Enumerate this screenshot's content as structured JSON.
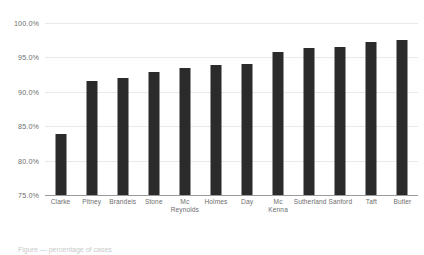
{
  "chart_data": {
    "type": "bar",
    "title": "",
    "subtitle": "",
    "xlabel": "",
    "ylabel": "",
    "ylim": [
      75.0,
      100.0
    ],
    "ytick_step": 5.0,
    "ytick_labels": [
      "100.0%",
      "95.0%",
      "90.0%",
      "85.0%",
      "80.0%",
      "75.0%"
    ],
    "ytick_values": [
      100.0,
      95.0,
      90.0,
      85.0,
      80.0,
      75.0
    ],
    "grid": true,
    "legend": false,
    "legend_position": "none",
    "bar_color": "#2b2b2b",
    "grid_color": "#e9e9e9",
    "axis_color": "#9a9a9a",
    "tick_label_color": "#6e6e6e",
    "categories": [
      "Clarke",
      "Pitney",
      "Brandeis",
      "Stone",
      "Mc Reynolds",
      "Holmes",
      "Day",
      "Mc Kenna",
      "Sutherland",
      "Sanford",
      "Taft",
      "Butler"
    ],
    "category_lines": [
      [
        "Clarke"
      ],
      [
        "Pitney"
      ],
      [
        "Brandeis"
      ],
      [
        "Stone"
      ],
      [
        "Mc",
        "Reynolds"
      ],
      [
        "Holmes"
      ],
      [
        "Day"
      ],
      [
        "Mc",
        "Kenna"
      ],
      [
        "Sutherland"
      ],
      [
        "Sanford"
      ],
      [
        "Taft"
      ],
      [
        "Butler"
      ]
    ],
    "values": [
      83.8,
      91.6,
      92.0,
      92.9,
      93.4,
      93.9,
      94.0,
      95.8,
      96.3,
      96.5,
      97.2,
      97.5
    ]
  },
  "caption": {
    "text": "Figure — percentage of cases"
  }
}
